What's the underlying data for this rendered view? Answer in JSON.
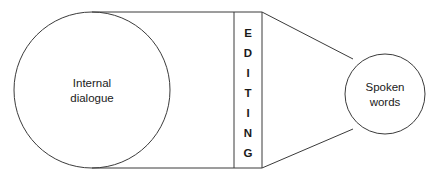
{
  "diagram": {
    "stroke_color": "#3b3b3b",
    "text_color": "#1a1a1a",
    "background_color": "#ffffff",
    "left_node": {
      "label_line_1": "Internal",
      "label_line_2": "dialogue",
      "shape": "circle",
      "cx": 92,
      "cy": 90,
      "r": 78
    },
    "right_node": {
      "label_line_1": "Spoken",
      "label_line_2": "words",
      "shape": "circle",
      "cx": 385,
      "cy": 94,
      "r": 40
    },
    "editing_band": {
      "label": "EDITING",
      "letters": [
        "E",
        "D",
        "I",
        "T",
        "I",
        "N",
        "G"
      ],
      "left_x": 234,
      "right_x": 262,
      "top_y": 12,
      "bottom_y": 168
    },
    "connectors": {
      "top_rail_label": "top-rail",
      "bottom_rail_label": "bottom-rail",
      "top_taper_label": "top-taper",
      "bottom_taper_label": "bottom-taper"
    }
  }
}
